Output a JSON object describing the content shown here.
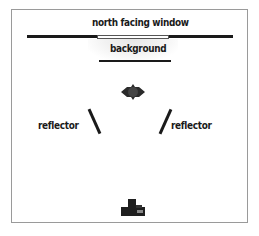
{
  "diagram": {
    "title": "north facing window",
    "background_label": "background",
    "reflector_left_label": "reflector",
    "reflector_right_label": "reflector",
    "elements": {
      "window": "north-facing-window-line",
      "background": "background-line",
      "subject": "subject-icon",
      "reflectors": [
        "left-reflector",
        "right-reflector"
      ],
      "camera": "camera-icon"
    },
    "colors": {
      "ink": "#1a1a1a",
      "frame": "#9a9a9a",
      "glow": "#e6e6e6"
    }
  }
}
